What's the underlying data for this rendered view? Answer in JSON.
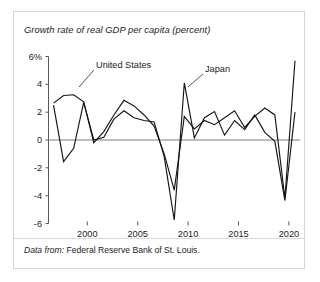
{
  "figure": {
    "title": "Growth rate of real GDP per capita (percent)",
    "source_label": "Data from:",
    "source_value": "Federal Reserve Bank of St. Louis.",
    "border_color": "#d5d5d5",
    "line_color": "#151515",
    "axis_color": "#5a5a5a"
  },
  "chart_data": {
    "type": "line",
    "title": "Growth rate of real GDP per capita (percent)",
    "xlabel": "",
    "ylabel": "percent",
    "xlim": [
      1996.5,
      2021.5
    ],
    "ylim": [
      -6,
      6
    ],
    "grid": false,
    "legend": "inline-annotations",
    "yticks": [
      6,
      4,
      2,
      0,
      -2,
      -4,
      -6
    ],
    "ytick_labels": [
      "6%",
      "4",
      "2",
      "0",
      "-2",
      "-4",
      "-6"
    ],
    "xticks": [
      2000,
      2005,
      2010,
      2015,
      2020
    ],
    "xtick_labels": [
      "2000",
      "2005",
      "2010",
      "2015",
      "2020"
    ],
    "x": [
      1997,
      1998,
      1999,
      2000,
      2001,
      2002,
      2003,
      2004,
      2005,
      2006,
      2007,
      2008,
      2009,
      2010,
      2011,
      2012,
      2013,
      2014,
      2015,
      2016,
      2017,
      2018,
      2019,
      2020,
      2021
    ],
    "series": [
      {
        "name": "United States",
        "annotation": "United States",
        "values": [
          2.65,
          3.2,
          3.25,
          2.75,
          -0.2,
          0.6,
          1.8,
          2.85,
          2.45,
          1.8,
          1.0,
          -1.0,
          -3.6,
          1.7,
          0.8,
          1.4,
          1.1,
          1.6,
          2.1,
          0.9,
          1.7,
          2.3,
          1.8,
          -4.2,
          5.7
        ]
      },
      {
        "name": "Japan",
        "annotation": "Japan",
        "values": [
          2.5,
          -1.55,
          -0.6,
          2.7,
          0.0,
          0.2,
          1.5,
          2.1,
          1.6,
          1.4,
          1.3,
          -1.2,
          -5.75,
          4.1,
          0.15,
          1.6,
          2.05,
          0.35,
          1.4,
          0.75,
          1.8,
          0.55,
          -0.1,
          -4.35,
          2.0
        ]
      }
    ],
    "annotations": [
      {
        "text": "United States",
        "series": "United States",
        "x_px": 96,
        "y_px": 66
      },
      {
        "text": "Japan",
        "series": "Japan",
        "x_px": 205,
        "y_px": 70
      }
    ]
  }
}
